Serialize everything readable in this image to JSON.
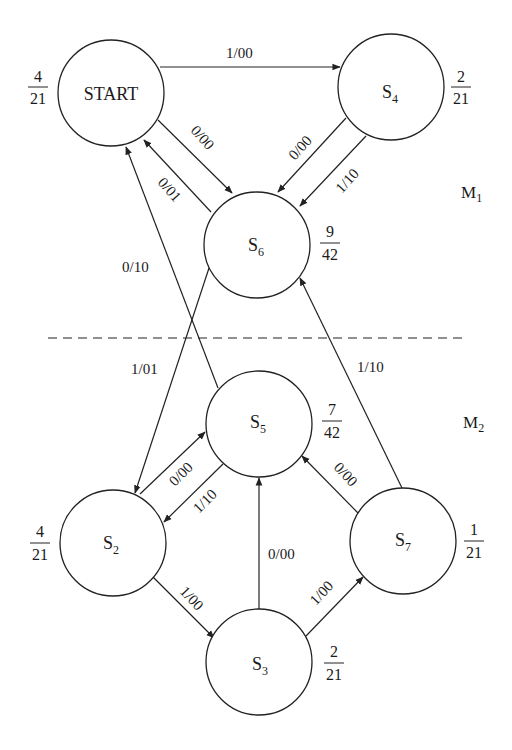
{
  "diagram": {
    "regions": [
      {
        "id": "M1",
        "label": "M",
        "sub": "1"
      },
      {
        "id": "M2",
        "label": "M",
        "sub": "2"
      }
    ],
    "states": [
      {
        "id": "START",
        "label": "START",
        "sub": "",
        "prob_num": "4",
        "prob_den": "21"
      },
      {
        "id": "S4",
        "label": "S",
        "sub": "4",
        "prob_num": "2",
        "prob_den": "21"
      },
      {
        "id": "S6",
        "label": "S",
        "sub": "6",
        "prob_num": "9",
        "prob_den": "42"
      },
      {
        "id": "S5",
        "label": "S",
        "sub": "5",
        "prob_num": "7",
        "prob_den": "42"
      },
      {
        "id": "S2",
        "label": "S",
        "sub": "2",
        "prob_num": "4",
        "prob_den": "21"
      },
      {
        "id": "S7",
        "label": "S",
        "sub": "7",
        "prob_num": "1",
        "prob_den": "21"
      },
      {
        "id": "S3",
        "label": "S",
        "sub": "3",
        "prob_num": "2",
        "prob_den": "21"
      }
    ],
    "edges": [
      {
        "from": "START",
        "to": "S4",
        "label": "1/00"
      },
      {
        "from": "START",
        "to": "S6",
        "label": "0/00"
      },
      {
        "from": "S6",
        "to": "START",
        "label": "0/01"
      },
      {
        "from": "S4",
        "to": "S6",
        "label": "0/00"
      },
      {
        "from": "S4",
        "to": "S6",
        "label": "1/10"
      },
      {
        "from": "S5",
        "to": "START",
        "label": "0/10"
      },
      {
        "from": "S6",
        "to": "S2",
        "label": "1/01"
      },
      {
        "from": "S7",
        "to": "S6",
        "label": "1/10"
      },
      {
        "from": "S2",
        "to": "S5",
        "label": "0/00"
      },
      {
        "from": "S5",
        "to": "S2",
        "label": "1/10"
      },
      {
        "from": "S7",
        "to": "S5",
        "label": "0/00"
      },
      {
        "from": "S3",
        "to": "S5",
        "label": "0/00"
      },
      {
        "from": "S2",
        "to": "S3",
        "label": "1/00"
      },
      {
        "from": "S3",
        "to": "S7",
        "label": "1/00"
      }
    ]
  }
}
